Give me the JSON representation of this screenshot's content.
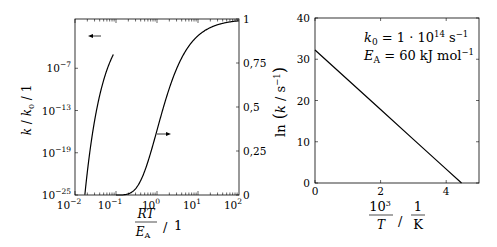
{
  "chart_data": [
    {
      "type": "line",
      "title": "",
      "xlabel": "RT / E_A / 1",
      "xlabel_parts": {
        "num": "RT",
        "den": "E",
        "den_sub": "A",
        "unit": "1"
      },
      "ylabel": "k / k0 / 1",
      "ylabel_parts": {
        "k": "k",
        "k0": "k",
        "sub": "0",
        "unit": "1"
      },
      "x_scale": "log",
      "xlim": [
        0.01,
        100
      ],
      "x_ticks": [
        {
          "base": "10",
          "exp": "−2"
        },
        {
          "base": "10",
          "exp": "−1"
        },
        {
          "base": "10",
          "exp": "0"
        },
        {
          "base": "10",
          "exp": "1"
        },
        {
          "base": "10",
          "exp": "2"
        }
      ],
      "y_left_scale": "log",
      "y_left_lim": [
        1e-25,
        1
      ],
      "y_left_ticks": [
        {
          "base": "10",
          "exp": "−25"
        },
        {
          "base": "10",
          "exp": "−19"
        },
        {
          "base": "10",
          "exp": "−13"
        },
        {
          "base": "10",
          "exp": "−7"
        }
      ],
      "y_right_scale": "linear",
      "y_right_lim": [
        0,
        1
      ],
      "y_right_ticks": [
        "0",
        "0,25",
        "0,5",
        "0,75",
        "1"
      ],
      "series": [
        {
          "name": "k/k0 (log, left axis)",
          "axis": "left",
          "function": "exp(-1/x)",
          "x": [
            0.0174,
            0.02,
            0.03,
            0.05,
            0.07,
            0.0868
          ],
          "y": [
            1e-25,
            1.9e-22,
            3.3e-15,
            2.1e-09,
            6.3e-07,
            1e-05
          ]
        },
        {
          "name": "k/k0 (linear, right axis)",
          "axis": "right",
          "function": "exp(-1/x)",
          "x": [
            0.1,
            0.2,
            0.5,
            1,
            2,
            5,
            10,
            100
          ],
          "y": [
            5e-05,
            0.0067,
            0.135,
            0.368,
            0.607,
            0.819,
            0.905,
            0.99
          ]
        }
      ],
      "annotations": [
        {
          "type": "arrow",
          "direction": "left",
          "near": "left curve",
          "meaning": "left axis"
        },
        {
          "type": "arrow",
          "direction": "right",
          "near": "right curve",
          "meaning": "right axis"
        }
      ],
      "grid": false
    },
    {
      "type": "line",
      "title": "",
      "xlabel": "10^3 / T / 1/K",
      "xlabel_parts": {
        "num": "10",
        "num_exp": "3",
        "den": "T",
        "unit_num": "1",
        "unit_den": "K"
      },
      "ylabel": "ln(k / s^-1)",
      "ylabel_parts": {
        "fn": "ln",
        "k": "k",
        "unit": "s",
        "unit_exp": "−1"
      },
      "xlim": [
        0,
        5
      ],
      "ylim": [
        0,
        40
      ],
      "x_ticks": [
        "0",
        "2",
        "4"
      ],
      "y_ticks": [
        "0",
        "10",
        "20",
        "30",
        "40"
      ],
      "series": [
        {
          "name": "ln k",
          "x": [
            0,
            1,
            2,
            3,
            4,
            4.467
          ],
          "y": [
            32.24,
            25.02,
            17.81,
            10.59,
            3.37,
            0
          ]
        }
      ],
      "annotations_text": [
        {
          "lhs": "k",
          "lhs_sub": "0",
          "rhs": "= 1 · 10",
          "rhs_exp": "14",
          "unit": " s",
          "unit_exp": "−1"
        },
        {
          "lhs": "E",
          "lhs_sub": "A",
          "rhs": "= 60 kJ mol",
          "rhs_exp": "−1"
        }
      ],
      "grid": false
    }
  ]
}
